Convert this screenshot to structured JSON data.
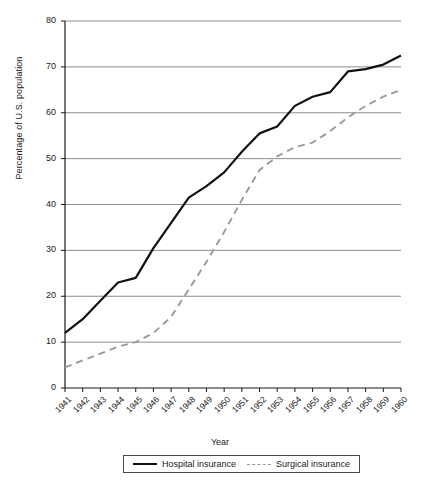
{
  "chart_data": {
    "type": "line",
    "title": "",
    "xlabel": "Year",
    "ylabel": "Percentage of U.S. population",
    "ylim": [
      0,
      80
    ],
    "ytick_step": 10,
    "grid": true,
    "legend_position": "bottom",
    "categories": [
      "1941",
      "1942",
      "1943",
      "1944",
      "1945",
      "1946",
      "1947",
      "1948",
      "1949",
      "1950",
      "1951",
      "1952",
      "1953",
      "1954",
      "1955",
      "1956",
      "1957",
      "1958",
      "1959",
      "1960"
    ],
    "yticks": [
      "0",
      "10",
      "20",
      "30",
      "40",
      "50",
      "60",
      "70",
      "80"
    ],
    "series": [
      {
        "name": "Hospital insurance",
        "style": "solid",
        "color": "#111111",
        "values": [
          12.0,
          15.0,
          19.0,
          23.0,
          24.0,
          30.5,
          36.0,
          41.5,
          44.0,
          47.0,
          51.5,
          55.5,
          57.0,
          61.5,
          63.5,
          64.5,
          69.0,
          69.5,
          70.5,
          72.5
        ]
      },
      {
        "name": "Surgical insurance",
        "style": "dashed",
        "color": "#9a9a9a",
        "values": [
          4.5,
          6.0,
          7.5,
          9.0,
          10.0,
          12.0,
          15.5,
          21.5,
          27.5,
          34.0,
          41.0,
          47.5,
          50.5,
          52.5,
          53.5,
          56.0,
          59.0,
          61.5,
          63.5,
          65.0
        ]
      }
    ]
  },
  "legend": {
    "items": [
      {
        "label": "Hospital insurance"
      },
      {
        "label": "Surgical insurance"
      }
    ]
  }
}
